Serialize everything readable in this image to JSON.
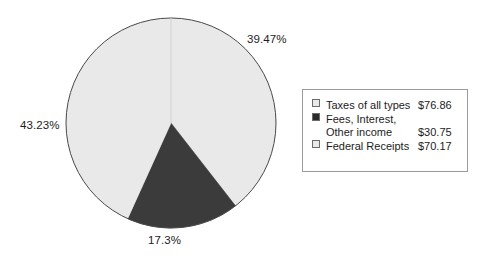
{
  "chart_data": {
    "type": "pie",
    "title": "",
    "subtitle": "",
    "labels": [
      "Taxes of all types",
      "Fees, Interest, Other income",
      "Federal Receipts"
    ],
    "values": [
      76.86,
      30.75,
      70.17
    ],
    "value_strings": [
      "$76.86",
      "$30.75",
      "$70.17"
    ],
    "percentages": [
      43.23,
      17.3,
      39.47
    ],
    "percent_labels": [
      "39.47%",
      "43.23%",
      "17.3%"
    ],
    "slice_colors": [
      "#e9e9e9",
      "#3b3b3b",
      "#e9e9e9"
    ],
    "legend_position": "right",
    "grid": false,
    "start_angle_deg": 0,
    "direction": "clockwise",
    "xlabel": "",
    "ylabel": ""
  },
  "pie": {
    "center_x": 171,
    "center_y": 123,
    "radius": 105,
    "outline_color": "#4a4a4a",
    "divider_color": "#d2d2d2",
    "wedges": [
      {
        "name": "federal-receipts",
        "percent": 39.47,
        "color": "#e9e9e9",
        "start_deg": 0.0,
        "end_deg": 142.092
      },
      {
        "name": "fees-interest-other-income",
        "percent": 17.3,
        "color": "#3b3b3b",
        "start_deg": 142.092,
        "end_deg": 204.372
      },
      {
        "name": "taxes-of-all-types",
        "percent": 43.23,
        "color": "#e9e9e9",
        "start_deg": 204.372,
        "end_deg": 360.0
      }
    ],
    "callouts": [
      {
        "name": "slice-percent-federal-receipts",
        "text": "39.47%"
      },
      {
        "name": "slice-percent-taxes",
        "text": "43.23%"
      },
      {
        "name": "slice-percent-fees-interest",
        "text": "17.3%"
      }
    ]
  },
  "legend": {
    "border_color": "#9a9a9a",
    "rows": [
      {
        "swatch_color": "#e9e9e9",
        "swatch_name": "legend-swatch-taxes-of-all-types",
        "label_line1": "Taxes of all types",
        "label_line2": "",
        "value": "$76.86"
      },
      {
        "swatch_color": "#2b2b2b",
        "swatch_name": "legend-swatch-fees-interest-other-income",
        "label_line1": "Fees, Interest,",
        "label_line2": "Other income",
        "value": "$30.75"
      },
      {
        "swatch_color": "#e9e9e9",
        "swatch_name": "legend-swatch-federal-receipts",
        "label_line1": "Federal Receipts",
        "label_line2": "",
        "value": "$70.17"
      }
    ]
  }
}
